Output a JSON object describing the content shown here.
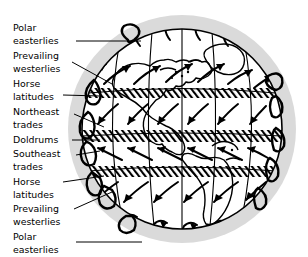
{
  "figure": {
    "type": "diagram",
    "background_color": "#ffffff",
    "globe": {
      "shadow_color": "#d9d9d9",
      "surface_color": "#ffffff",
      "outline_color": "#000000",
      "center_x": 182,
      "center_y": 129,
      "shadow_radius": 114,
      "surface_radius": 100
    },
    "band_fill": {
      "style": "diagonal-hatch",
      "line_color": "#000000"
    }
  },
  "labels": [
    {
      "id": "polar-easterlies-north",
      "line1": "Polar",
      "line2": "easterlies",
      "x": 13,
      "y1": 31,
      "y2": 44
    },
    {
      "id": "prevailing-westerlies-north",
      "line1": "Prevailing",
      "line2": "westerlies",
      "x": 13,
      "y1": 59,
      "y2": 72
    },
    {
      "id": "horse-latitudes-north",
      "line1": "Horse",
      "line2": "latitudes",
      "x": 13,
      "y1": 87,
      "y2": 100
    },
    {
      "id": "northeast-trades",
      "line1": "Northeast",
      "line2": "trades",
      "x": 13,
      "y1": 115,
      "y2": 128
    },
    {
      "id": "doldrums",
      "line1": "Doldrums",
      "line2": "",
      "x": 13,
      "y1": 143,
      "y2": 0
    },
    {
      "id": "southeast-trades",
      "line1": "Southeast",
      "line2": "trades",
      "x": 13,
      "y1": 157,
      "y2": 170
    },
    {
      "id": "horse-latitudes-south",
      "line1": "Horse",
      "line2": "latitudes",
      "x": 13,
      "y1": 185,
      "y2": 198
    },
    {
      "id": "prevailing-westerlies-south",
      "line1": "Prevailing",
      "line2": "westerlies",
      "x": 13,
      "y1": 212,
      "y2": 225
    },
    {
      "id": "polar-easterlies-south",
      "line1": "Polar",
      "line2": "easterlies",
      "x": 13,
      "y1": 240,
      "y2": 253
    }
  ],
  "wind_belts": [
    {
      "name": "Polar easterlies",
      "hemisphere": "north",
      "banded": false
    },
    {
      "name": "Prevailing westerlies",
      "hemisphere": "north",
      "banded": false
    },
    {
      "name": "Horse latitudes",
      "hemisphere": "north",
      "banded": true
    },
    {
      "name": "Northeast trades",
      "hemisphere": "north",
      "banded": false
    },
    {
      "name": "Doldrums",
      "hemisphere": "equator",
      "banded": true
    },
    {
      "name": "Southeast trades",
      "hemisphere": "south",
      "banded": false
    },
    {
      "name": "Horse latitudes",
      "hemisphere": "south",
      "banded": true
    },
    {
      "name": "Prevailing westerlies",
      "hemisphere": "south",
      "banded": false
    },
    {
      "name": "Polar easterlies",
      "hemisphere": "south",
      "banded": false
    }
  ]
}
